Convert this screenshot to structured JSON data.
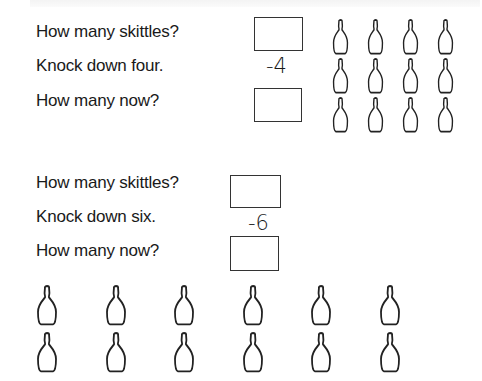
{
  "worksheet": {
    "exercise1": {
      "prompts": {
        "how_many": "How many skittles?",
        "knock_down": "Knock down four.",
        "how_many_now": "How many now?"
      },
      "subtract_label": "-4",
      "answer_boxes": [
        {
          "name": "starting-count",
          "value": ""
        },
        {
          "name": "remaining-count",
          "value": ""
        }
      ],
      "skittles": {
        "rows": 3,
        "columns": 4,
        "count": 12
      }
    },
    "exercise2": {
      "prompts": {
        "how_many": "How many skittles?",
        "knock_down": "Knock down six.",
        "how_many_now": "How many now?"
      },
      "subtract_label": "-6",
      "answer_boxes": [
        {
          "name": "starting-count",
          "value": ""
        },
        {
          "name": "remaining-count",
          "value": ""
        }
      ],
      "skittles": {
        "rows": 2,
        "columns": 6,
        "count": 12
      }
    }
  },
  "colors": {
    "ink": "#1a1a1a",
    "box_border": "#333333",
    "background": "#ffffff"
  }
}
